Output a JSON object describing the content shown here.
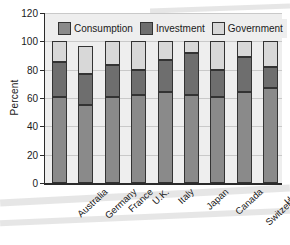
{
  "chart_data": {
    "type": "bar",
    "subtype": "stacked-bar",
    "title": "",
    "xlabel": "",
    "ylabel": "Percent",
    "ylim": [
      0,
      120
    ],
    "yticks": [
      0,
      20,
      40,
      60,
      80,
      100,
      120
    ],
    "ytick_labels": [
      "0",
      "20",
      "40",
      "60",
      "80",
      "100",
      "120"
    ],
    "grid": true,
    "legend_position": "top-inside",
    "categories": [
      "Australia",
      "Germany",
      "France",
      "U.K.",
      "Italy",
      "Japan",
      "Canada",
      "Switzerland",
      "U.S."
    ],
    "series": [
      {
        "name": "Consumption",
        "color": "#8a8a8a",
        "values": [
          61,
          55,
          61,
          62,
          64,
          62,
          61,
          64,
          67
        ]
      },
      {
        "name": "Investment",
        "color": "#6e6e6e",
        "values": [
          24.5,
          22,
          22,
          18,
          23,
          30,
          19,
          25,
          15
        ]
      },
      {
        "name": "Government",
        "color": "#d8d8d8",
        "values": [
          14.5,
          20,
          17,
          20,
          13,
          8,
          20,
          11,
          18
        ]
      }
    ],
    "cumulative_tops": [
      [
        61,
        85.5,
        100
      ],
      [
        55,
        77,
        97
      ],
      [
        61,
        83,
        100
      ],
      [
        62,
        80,
        100
      ],
      [
        64,
        87,
        100
      ],
      [
        62,
        92,
        100
      ],
      [
        61,
        80,
        100
      ],
      [
        64,
        89,
        100
      ],
      [
        67,
        82,
        100
      ]
    ]
  },
  "legend": {
    "entries": [
      {
        "label": "Consumption",
        "color": "#8a8a8a"
      },
      {
        "label": "Investment",
        "color": "#6e6e6e"
      },
      {
        "label": "Government",
        "color": "#d8d8d8"
      }
    ]
  },
  "colors": {
    "plot_background": "#eeeeee",
    "page_background": "#ffffff",
    "gridline": "#c9c9c9",
    "axis": "#2b2b2b",
    "bar_outline": "#333333",
    "text": "#1a1a1a"
  }
}
